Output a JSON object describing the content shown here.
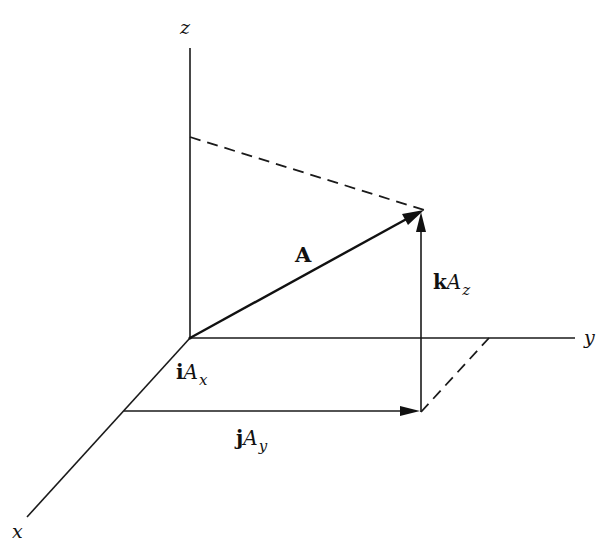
{
  "diagram": {
    "type": "3d-vector-components",
    "colors": {
      "ink": "#111111",
      "background": "#ffffff"
    },
    "axes": {
      "x": {
        "label": "x"
      },
      "y": {
        "label": "y"
      },
      "z": {
        "label": "z"
      }
    },
    "vector": {
      "label": "A"
    },
    "components": {
      "x": {
        "unit": "i",
        "magnitude": "A",
        "subscript": "x"
      },
      "y": {
        "unit": "j",
        "magnitude": "A",
        "subscript": "y"
      },
      "z": {
        "unit": "k",
        "magnitude": "A",
        "subscript": "z"
      }
    },
    "geometry": {
      "origin": [
        190,
        338
      ],
      "z_axis_top": [
        190,
        48
      ],
      "y_axis_end": [
        575,
        338
      ],
      "x_axis_end": [
        27,
        517
      ],
      "vector_tip": [
        424,
        210
      ],
      "z_projection_on_axis": [
        190,
        137
      ],
      "xy_projection": [
        421,
        412
      ],
      "x_component_end": [
        124,
        411
      ],
      "y_projection_on_axis": [
        489,
        338
      ]
    }
  }
}
